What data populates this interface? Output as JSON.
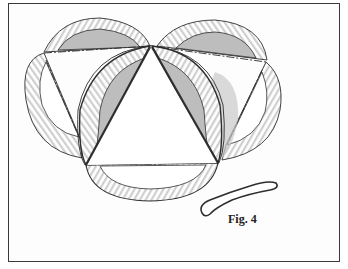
{
  "figure": {
    "caption": "Fig. 4",
    "colors": {
      "line": "#2e2e2e",
      "shade": "#b8b8b8",
      "rim_ticks": "#c4c4c4",
      "paper": "#ffffff"
    },
    "parts": [
      {
        "name": "center-triangle"
      },
      {
        "name": "bottom-plate"
      },
      {
        "name": "left-front-plate"
      },
      {
        "name": "right-front-plate"
      },
      {
        "name": "upper-left-plate"
      },
      {
        "name": "left-plate"
      },
      {
        "name": "upper-right-plate"
      },
      {
        "name": "right-plate"
      },
      {
        "name": "rubber-band"
      }
    ]
  }
}
